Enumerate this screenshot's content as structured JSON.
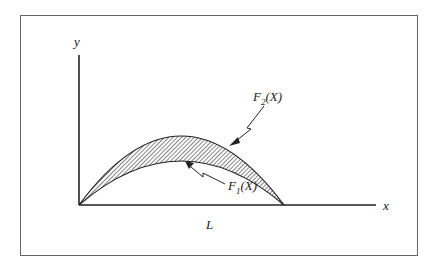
{
  "diagram": {
    "axis_y_label": "y",
    "axis_x_label": "x",
    "length_label": "L",
    "upper_curve": {
      "name": "F",
      "sub": "2",
      "arg": "(X)"
    },
    "lower_curve": {
      "name": "F",
      "sub": "1",
      "arg": "(X)"
    },
    "region_fill": "hatched",
    "colors": {
      "line": "#222222",
      "frame": "#555555",
      "hatch": "#333333"
    }
  }
}
